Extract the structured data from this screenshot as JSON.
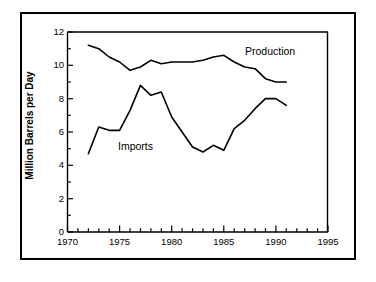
{
  "chart_data": {
    "type": "line",
    "title": "",
    "subtitle": "",
    "xlabel": "",
    "ylabel": "Million Barrels per Day",
    "xlim": [
      1970,
      1995
    ],
    "ylim": [
      0,
      12
    ],
    "xticks": [
      1970,
      1975,
      1980,
      1985,
      1990,
      1995
    ],
    "xtick_labels": [
      "1970",
      "1975",
      "1980",
      "1985",
      "1990",
      "1995"
    ],
    "yticks": [
      0,
      2,
      4,
      6,
      8,
      10,
      12
    ],
    "ytick_labels": [
      "0",
      "2",
      "4",
      "6",
      "8",
      "10",
      "12"
    ],
    "x_minor_tick_interval": 1,
    "y_minor_tick_interval": 1,
    "grid": false,
    "legend_position": "inline-annotation",
    "line_color": "#000000",
    "background_color": "#ffffff",
    "series": [
      {
        "name": "Production",
        "label": "Production",
        "x": [
          1972,
          1973,
          1974,
          1975,
          1976,
          1977,
          1978,
          1979,
          1980,
          1981,
          1982,
          1983,
          1984,
          1985,
          1986,
          1987,
          1988,
          1989,
          1990,
          1991
        ],
        "values": [
          11.2,
          11.0,
          10.5,
          10.2,
          9.7,
          9.9,
          10.3,
          10.1,
          10.2,
          10.2,
          10.2,
          10.3,
          10.5,
          10.6,
          10.2,
          9.9,
          9.8,
          9.2,
          9.0,
          9.0
        ]
      },
      {
        "name": "Imports",
        "label": "Imports",
        "x": [
          1972,
          1973,
          1974,
          1975,
          1976,
          1977,
          1978,
          1979,
          1980,
          1981,
          1982,
          1983,
          1984,
          1985,
          1986,
          1987,
          1988,
          1989,
          1990,
          1991
        ],
        "values": [
          4.7,
          6.3,
          6.1,
          6.1,
          7.3,
          8.8,
          8.2,
          8.4,
          6.9,
          6.0,
          5.1,
          4.8,
          5.2,
          4.9,
          6.2,
          6.7,
          7.4,
          8.0,
          8.0,
          7.6
        ]
      }
    ]
  },
  "axis": {
    "y_title": "Million Barrels per Day"
  }
}
